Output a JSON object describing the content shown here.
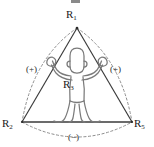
{
  "figure": {
    "type": "geometric-diagram",
    "background_color": "#ffffff",
    "line_color": "#3a3a3a",
    "dashed_color": "#8a8a8a",
    "figure_outline_color": "#6b6b6b",
    "labels": {
      "apex": {
        "base": "R",
        "sub": "1",
        "text": "R1"
      },
      "bottom_left": {
        "base": "R",
        "sub": "2",
        "text": "R2"
      },
      "center": {
        "base": "R",
        "sub": "3",
        "text": "R3"
      },
      "bottom_right": {
        "base": "R",
        "sub": "5",
        "text": "R5"
      }
    },
    "annotations": {
      "left_arc_sign": "(+)",
      "right_arc_sign": "(+)",
      "bottom_arc_sign": "(−)"
    },
    "geometry": {
      "apex": [
        77,
        28
      ],
      "bottom_left": [
        22,
        122
      ],
      "bottom_right": [
        132,
        122
      ],
      "triangle_edges": "solid",
      "arcs": "dashed, bowing outward from each triangle edge"
    },
    "human_figure": {
      "description": "standing person with arms raised overhead gripping the two upper triangle edges, legs apart on the base",
      "head_center": [
        77,
        62
      ],
      "stance": "arms-up"
    }
  }
}
